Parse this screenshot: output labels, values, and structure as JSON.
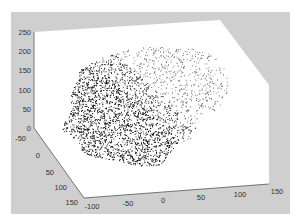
{
  "figure": {
    "background": "#ffffff",
    "panel_color": "#cfcfcf",
    "axes_face_color": "#ffffff",
    "point_dark_color": "#1a1a1a",
    "point_light_color": "#8a8a8a"
  },
  "chart_data": {
    "type": "scatter",
    "subtype": "3d-point-cloud",
    "title": "",
    "xlabel": "",
    "ylabel": "",
    "zlabel": "",
    "x_axis": {
      "ticks": [
        "-100",
        "-50",
        "0",
        "50",
        "100",
        "150"
      ],
      "range": [
        -100,
        150
      ]
    },
    "y_axis": {
      "ticks": [
        "-50",
        "0",
        "50",
        "100",
        "150"
      ],
      "range": [
        -50,
        150
      ]
    },
    "z_axis": {
      "ticks": [
        "0",
        "50",
        "100",
        "150",
        "200",
        "250"
      ],
      "range": [
        0,
        250
      ]
    },
    "grid": false,
    "legend": null
  }
}
